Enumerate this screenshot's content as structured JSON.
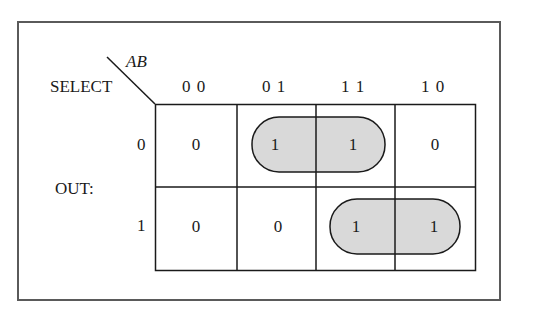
{
  "diagram": {
    "type": "karnaugh-map",
    "corner": {
      "column_variable": "AB",
      "row_variable": "SELECT"
    },
    "side_label": "OUT:",
    "column_headers": [
      "0 0",
      "0 1",
      "1 1",
      "1 0"
    ],
    "row_headers": [
      "0",
      "1"
    ],
    "cells": [
      [
        "0",
        "1",
        "1",
        "0"
      ],
      [
        "0",
        "0",
        "1",
        "1"
      ]
    ],
    "groups": [
      {
        "row": 0,
        "columns": [
          "0 1",
          "1 1"
        ],
        "fill": "#d9d9d9"
      },
      {
        "row": 1,
        "columns": [
          "1 1",
          "1 0"
        ],
        "fill": "#d9d9d9"
      }
    ],
    "colors": {
      "frame": "#5a5a5a",
      "grid": "#1a1a1a",
      "group_fill": "#d9d9d9"
    }
  }
}
